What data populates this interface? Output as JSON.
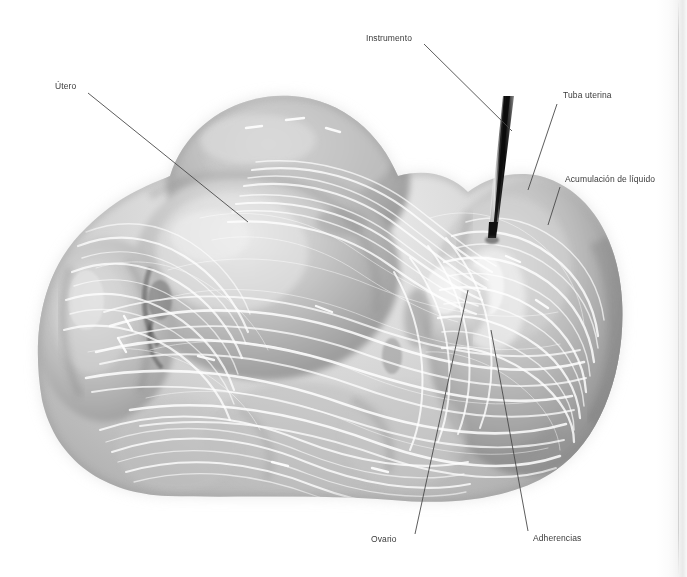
{
  "figure": {
    "modality": "grayscale medical illustration",
    "background_color": "#ffffff",
    "leader_line_color": "#4a4a4a",
    "label_color": "#3a3a3a",
    "tissue_tone_light": "#e8e8e8",
    "tissue_tone_mid": "#b9b9b9",
    "tissue_tone_dark": "#8a8a8a",
    "adhesion_strand_color": "#ffffff",
    "instrument_color": "#141414"
  },
  "labels": [
    {
      "id": "instrumento",
      "text": "Instrumento",
      "x": 366,
      "y": 38,
      "anchor": "end",
      "leader": {
        "x1": 424,
        "y1": 44,
        "x2": 512,
        "y2": 131
      }
    },
    {
      "id": "utero",
      "text": "Útero",
      "x": 55,
      "y": 86,
      "anchor": "start",
      "leader": {
        "x1": 88,
        "y1": 93,
        "x2": 248,
        "y2": 222
      }
    },
    {
      "id": "tuba-uterina",
      "text": "Tuba uterina",
      "x": 563,
      "y": 95,
      "anchor": "start",
      "leader": {
        "x1": 557,
        "y1": 104,
        "x2": 528,
        "y2": 190
      }
    },
    {
      "id": "acumulacion",
      "text": "Acumulación de líquido",
      "x": 565,
      "y": 179,
      "anchor": "start",
      "leader": {
        "x1": 560,
        "y1": 187,
        "x2": 548,
        "y2": 225
      }
    },
    {
      "id": "ovario",
      "text": "Ovario",
      "x": 371,
      "y": 539,
      "anchor": "start",
      "leader": {
        "x1": 415,
        "y1": 534,
        "x2": 468,
        "y2": 290
      }
    },
    {
      "id": "adherencias",
      "text": "Adherencias",
      "x": 533,
      "y": 538,
      "anchor": "start",
      "leader": {
        "x1": 528,
        "y1": 531,
        "x2": 491,
        "y2": 330
      }
    }
  ],
  "structures": [
    {
      "id": "uterus-body",
      "name": "Útero"
    },
    {
      "id": "fallopian-tube",
      "name": "Tuba uterina"
    },
    {
      "id": "fluid-pocket",
      "name": "Acumulación de líquido"
    },
    {
      "id": "ovary",
      "name": "Ovario"
    },
    {
      "id": "adhesions",
      "name": "Adherencias"
    },
    {
      "id": "instrument",
      "name": "Instrumento"
    }
  ]
}
